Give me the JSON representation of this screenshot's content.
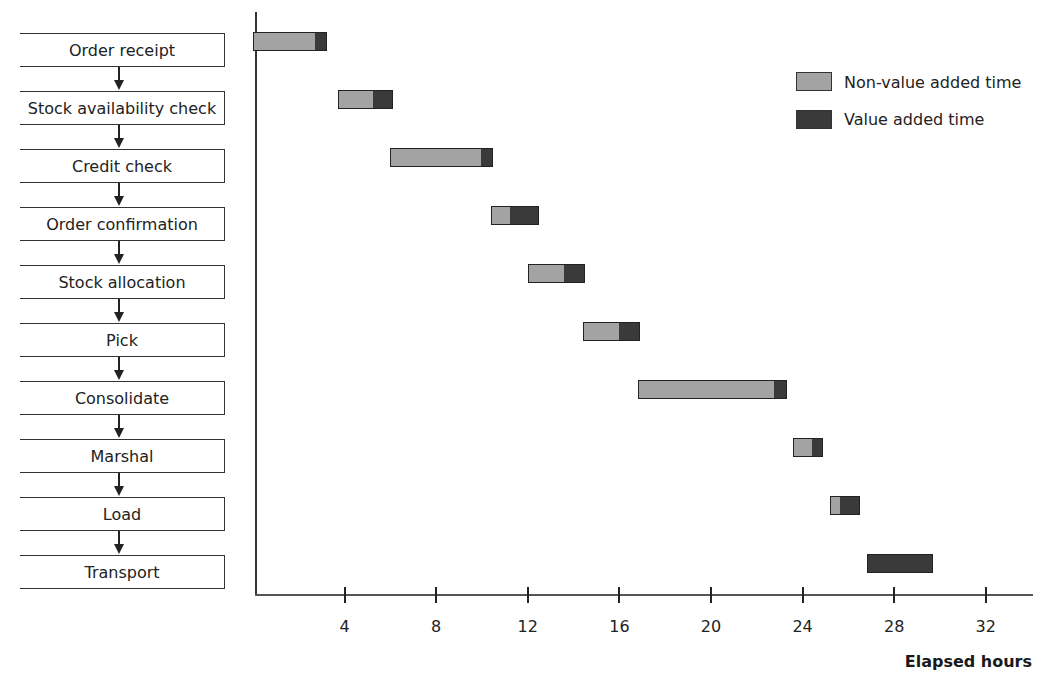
{
  "chart_data": {
    "type": "bar",
    "subtype": "gantt-stacked-horizontal",
    "title": "",
    "xlabel": "Elapsed hours",
    "ylabel": "",
    "xlim": [
      0,
      34
    ],
    "xticks": [
      4,
      8,
      12,
      16,
      20,
      24,
      28,
      32
    ],
    "grid": false,
    "legend_position": "upper right",
    "categories": [
      "Order receipt",
      "Stock availability check",
      "Credit check",
      "Order confirmation",
      "Stock allocation",
      "Pick",
      "Consolidate",
      "Marshal",
      "Load",
      "Transport"
    ],
    "series": [
      {
        "name": "Non-value added time",
        "color": "#a3a3a3",
        "intervals": [
          [
            0,
            2.75
          ],
          [
            3.7,
            5.25
          ],
          [
            6.0,
            10.0
          ],
          [
            10.4,
            11.2
          ],
          [
            12.0,
            13.6
          ],
          [
            14.4,
            16.0
          ],
          [
            16.8,
            22.8
          ],
          [
            23.6,
            24.4
          ],
          [
            25.2,
            25.6
          ],
          null
        ]
      },
      {
        "name": "Value added time",
        "color": "#3a3a3a",
        "intervals": [
          [
            2.75,
            3.25
          ],
          [
            5.25,
            6.1
          ],
          [
            10.0,
            10.5
          ],
          [
            11.2,
            12.5
          ],
          [
            13.6,
            14.5
          ],
          [
            16.0,
            16.9
          ],
          [
            22.8,
            23.3
          ],
          [
            24.4,
            24.9
          ],
          [
            25.6,
            26.5
          ],
          [
            26.8,
            29.7
          ]
        ]
      }
    ]
  },
  "process_steps": [
    "Order receipt",
    "Stock availability check",
    "Credit check",
    "Order confirmation",
    "Stock allocation",
    "Pick",
    "Consolidate",
    "Marshal",
    "Load",
    "Transport"
  ],
  "legend": {
    "nva_label": "Non-value added time",
    "va_label": "Value added time"
  },
  "axis": {
    "xlabel": "Elapsed hours",
    "ticks": [
      "4",
      "8",
      "12",
      "16",
      "20",
      "24",
      "28",
      "32"
    ]
  },
  "colors": {
    "nva": "#a3a3a3",
    "va": "#3a3a3a"
  }
}
